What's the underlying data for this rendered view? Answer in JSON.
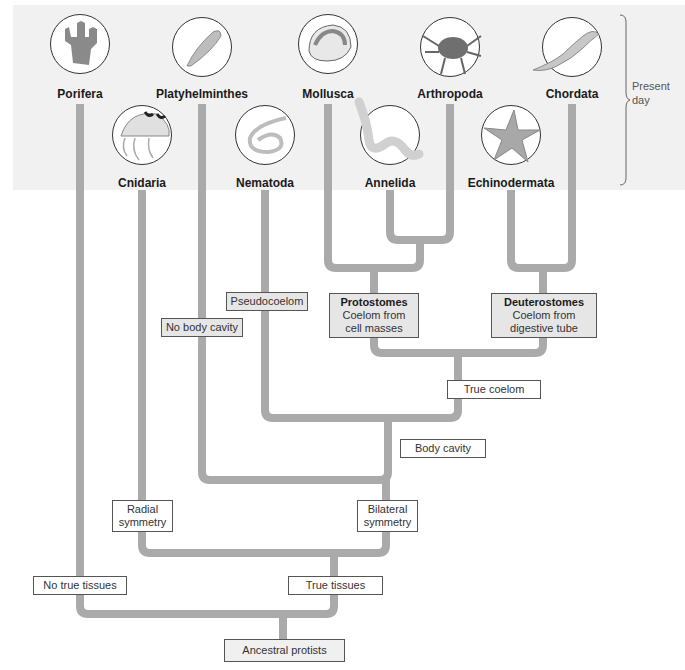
{
  "present_day": {
    "line1": "Present",
    "line2": "day"
  },
  "taxa": [
    {
      "name": "Porifera",
      "icon": "sponge-icon"
    },
    {
      "name": "Cnidaria",
      "icon": "jellyfish-icon"
    },
    {
      "name": "Platyhelminthes",
      "icon": "flatworm-icon"
    },
    {
      "name": "Nematoda",
      "icon": "roundworm-icon"
    },
    {
      "name": "Mollusca",
      "icon": "shell-icon"
    },
    {
      "name": "Annelida",
      "icon": "segmented-worm-icon"
    },
    {
      "name": "Arthropoda",
      "icon": "crab-icon"
    },
    {
      "name": "Echinodermata",
      "icon": "starfish-icon"
    },
    {
      "name": "Chordata",
      "icon": "lizard-icon"
    }
  ],
  "labels": {
    "pseudocoelom": "Pseudocoelom",
    "no_body_cavity": "No body cavity",
    "protostomes": {
      "title": "Protostomes",
      "line1": "Coelom from",
      "line2": "cell masses"
    },
    "deuterostomes": {
      "title": "Deuterostomes",
      "line1": "Coelom from",
      "line2": "digestive tube"
    },
    "true_coelom": "True coelom",
    "body_cavity": "Body cavity",
    "radial_symmetry": {
      "line1": "Radial",
      "line2": "symmetry"
    },
    "bilateral_symmetry": {
      "line1": "Bilateral",
      "line2": "symmetry"
    },
    "no_true_tissues": "No true tissues",
    "true_tissues": "True tissues",
    "ancestral_protists": "Ancestral protists"
  },
  "colors": {
    "branch": "#aaaaaa",
    "band": "#f1f1f1",
    "shaded_box": "#e6e6e6"
  }
}
